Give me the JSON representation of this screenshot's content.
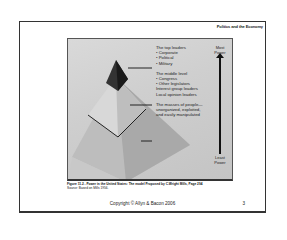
{
  "slide": {
    "header_title": "Politics and the Economy",
    "figure": {
      "top_group": {
        "heading": "The top leaders",
        "items": [
          "• Corporate",
          "• Political",
          "• Military"
        ]
      },
      "middle_group": {
        "heading": "The middle level",
        "items": [
          "• Congress",
          "• Other legislators",
          "Interest group leaders",
          "Local opinion leaders"
        ]
      },
      "bottom_group": {
        "lines": [
          "The masses of people—",
          "unorganized, exploited,",
          "and easily manipulated"
        ]
      },
      "scale_top": [
        "Most",
        "Power"
      ],
      "scale_bottom": [
        "Least",
        "Power"
      ]
    },
    "caption": "Figure 11.2 - Power in the United States: The model Proposed by C.Wright Mills, Page 294",
    "source": "Source: Based on Mills 1956.",
    "copyright": "Copyright © Allyn & Bacon 2006",
    "page_number": "3"
  }
}
